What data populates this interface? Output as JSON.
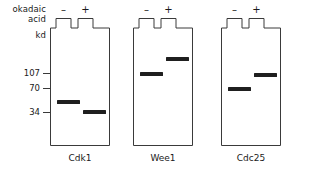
{
  "figure": {
    "type": "western-blot-schematic",
    "row_label_line1": "okadaic",
    "row_label_line2": "acid",
    "units_label": "kd",
    "lane_signs": [
      "–",
      "+"
    ],
    "molecular_weight_markers": [
      {
        "label": "107",
        "y": 73
      },
      {
        "label": "70",
        "y": 88
      },
      {
        "label": "34",
        "y": 112
      }
    ],
    "gels": [
      {
        "name": "Cdk1",
        "x": 50,
        "width": 60,
        "lanes": [
          {
            "sign": "–",
            "band_y": 100,
            "band_x": 7,
            "band_w": 23
          },
          {
            "sign": "+",
            "band_y": 110,
            "band_x": 33,
            "band_w": 23
          }
        ]
      },
      {
        "name": "Wee1",
        "x": 133,
        "width": 60,
        "lanes": [
          {
            "sign": "–",
            "band_y": 72,
            "band_x": 7,
            "band_w": 23
          },
          {
            "sign": "+",
            "band_y": 57,
            "band_x": 33,
            "band_w": 23
          }
        ]
      },
      {
        "name": "Cdc25",
        "x": 221,
        "width": 60,
        "lanes": [
          {
            "sign": "–",
            "band_y": 87,
            "band_x": 7,
            "band_w": 23
          },
          {
            "sign": "+",
            "band_y": 73,
            "band_x": 33,
            "band_w": 23
          }
        ]
      }
    ],
    "colors": {
      "band": "#1f1f1f",
      "outline": "#3a3a3a",
      "text": "#1a1a1a",
      "background": "#ffffff"
    }
  }
}
